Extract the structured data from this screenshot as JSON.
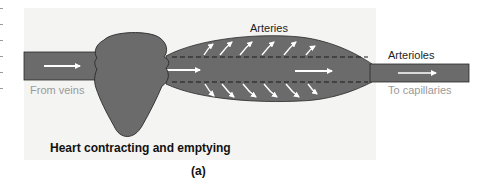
{
  "figure": {
    "panel_label": "(a)",
    "caption": "Heart contracting and emptying",
    "labels": {
      "arteries": "Arteries",
      "arterioles": "Arterioles",
      "from_veins": "From veins",
      "to_capillaries": "To capillaries"
    },
    "colors": {
      "vessel_fill": "#6b6b6b",
      "vessel_stroke": "#2a2a2a",
      "arrow": "#ffffff",
      "panel_bg": "#f4f4f2",
      "secondary_text": "#9a9a9a"
    }
  }
}
